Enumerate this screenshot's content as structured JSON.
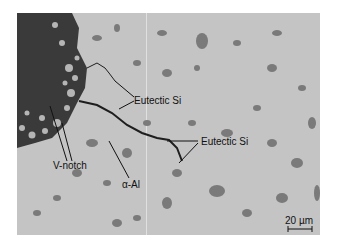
{
  "figure": {
    "type": "optical micrograph",
    "labels": {
      "eutectic_si_1": "Eutectic Si",
      "eutectic_si_2": "Eutectic Si",
      "v_notch": "V-notch",
      "alpha_al": "α-Al",
      "scale_bar": "20 µm"
    },
    "colors": {
      "matrix": "#c4c4c4",
      "notch_region": "#3a3a3a",
      "particles": "#7a7a7a",
      "crack": "#1e1e1e",
      "annotation": "#111111"
    }
  }
}
